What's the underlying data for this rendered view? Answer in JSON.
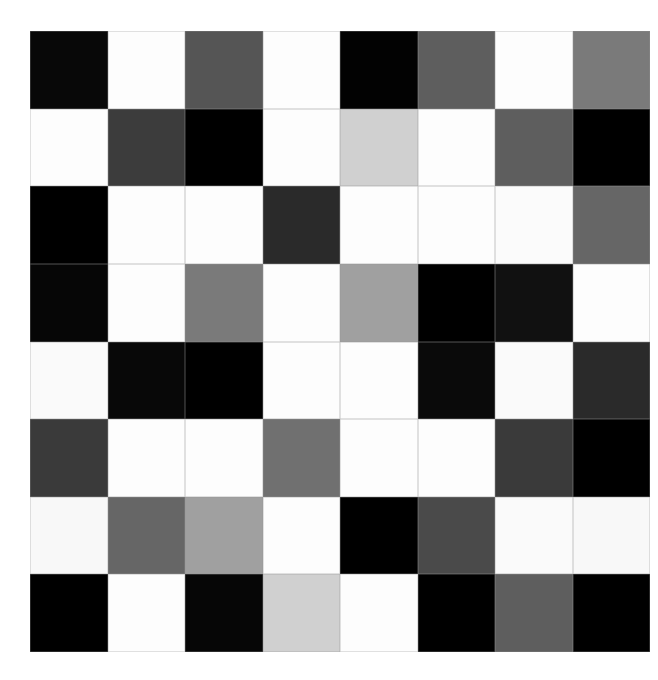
{
  "grid": {
    "rows": 8,
    "cols": 8,
    "cells": [
      [
        "#080808",
        "#fdfdfd",
        "#555555",
        "#fdfdfd",
        "#020202",
        "#5e5e5e",
        "#fdfdfd",
        "#7a7a7a"
      ],
      [
        "#fdfdfd",
        "#3c3c3c",
        "#000000",
        "#fdfdfd",
        "#d0d0d0",
        "#fdfdfd",
        "#5e5e5e",
        "#000000"
      ],
      [
        "#000000",
        "#fdfdfd",
        "#fdfdfd",
        "#2a2a2a",
        "#fdfdfd",
        "#fdfdfd",
        "#fbfbfb",
        "#666666"
      ],
      [
        "#060606",
        "#fdfdfd",
        "#7a7a7a",
        "#fdfdfd",
        "#a0a0a0",
        "#000000",
        "#111111",
        "#fdfdfd"
      ],
      [
        "#fafafa",
        "#080808",
        "#000000",
        "#fdfdfd",
        "#fdfdfd",
        "#0a0a0a",
        "#fafafa",
        "#2a2a2a"
      ],
      [
        "#3a3a3a",
        "#fdfdfd",
        "#fdfdfd",
        "#707070",
        "#fdfdfd",
        "#fdfdfd",
        "#3a3a3a",
        "#000000"
      ],
      [
        "#f8f8f8",
        "#666666",
        "#a0a0a0",
        "#fdfdfd",
        "#000000",
        "#4a4a4a",
        "#fafafa",
        "#f8f8f8"
      ],
      [
        "#000000",
        "#fdfdfd",
        "#060606",
        "#d0d0d0",
        "#fdfdfd",
        "#000000",
        "#5e5e5e",
        "#000000"
      ]
    ]
  }
}
